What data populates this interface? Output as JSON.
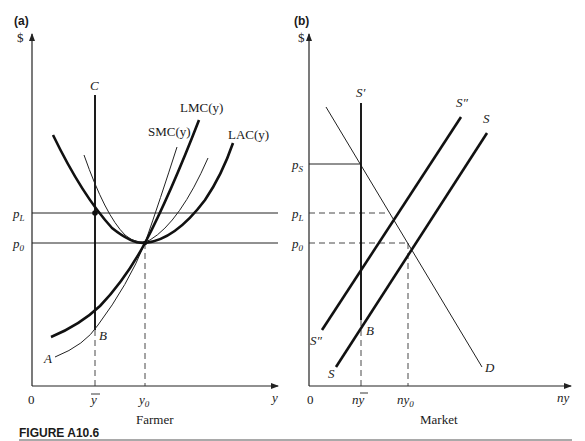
{
  "figure": {
    "caption": "FIGURE A10.6",
    "panels": [
      {
        "id": "a",
        "panel_label": "(a)",
        "y_axis_label": "$",
        "x_axis_label": "y",
        "title": "Farmer",
        "origin_label": "0",
        "x_ticks": [
          "ȳ",
          "y0"
        ],
        "y_ticks": [
          "pL",
          "p0"
        ],
        "curves": [
          "C",
          "LMC(y)",
          "SMC(y)",
          "LAC(y)",
          "A",
          "B"
        ]
      },
      {
        "id": "b",
        "panel_label": "(b)",
        "y_axis_label": "$",
        "x_axis_label": "ny",
        "title": "Market",
        "origin_label": "0",
        "x_ticks": [
          "nȳ",
          "ny0"
        ],
        "y_ticks": [
          "pS",
          "pL",
          "p0"
        ],
        "curves": [
          "S′",
          "S″",
          "S",
          "D",
          "B"
        ]
      }
    ]
  },
  "labels": {
    "a_panel": "(a)",
    "a_dollar": "$",
    "a_C": "C",
    "a_LMC": "LMC(y)",
    "a_SMC": "SMC(y)",
    "a_LAC": "LAC(y)",
    "a_pL_main": "p",
    "a_pL_sub": "L",
    "a_p0_main": "p",
    "a_p0_sub": "0",
    "a_B": "B",
    "a_A": "A",
    "a_origin": "0",
    "a_ybar": "y",
    "a_y0_main": "y",
    "a_y0_sub": "0",
    "a_xaxis": "y",
    "a_title": "Farmer",
    "b_panel": "(b)",
    "b_dollar": "$",
    "b_Sprime": "S′",
    "b_Sdouble_top": "S″",
    "b_S_top": "S",
    "b_pS_main": "p",
    "b_pS_sub": "S",
    "b_pL_main": "p",
    "b_pL_sub": "L",
    "b_p0_main": "p",
    "b_p0_sub": "0",
    "b_Sdouble_bottom": "S″",
    "b_B": "B",
    "b_S_bottom": "S",
    "b_D": "D",
    "b_origin": "0",
    "b_nybar_n": "n",
    "b_nybar_y": "y",
    "b_ny0_main": "ny",
    "b_ny0_sub": "0",
    "b_xaxis": "ny",
    "b_title": "Market",
    "caption": "FIGURE A10.6"
  }
}
